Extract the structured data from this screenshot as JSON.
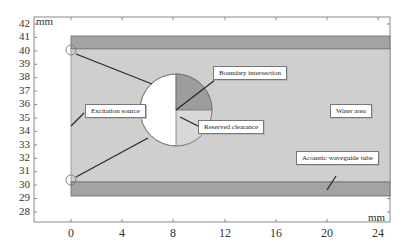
{
  "figure": {
    "units": {
      "x": "mm",
      "y": "mm"
    },
    "y_ticks": [
      "42",
      "41",
      "40",
      "39",
      "38",
      "37",
      "36",
      "35",
      "34",
      "33",
      "32",
      "31",
      "30",
      "29",
      "28"
    ],
    "x_ticks": [
      "0",
      "4",
      "8",
      "12",
      "16",
      "20",
      "24"
    ],
    "labels": {
      "excitation_source": "Excitation source",
      "boundary_intersection": "Boundary intersection",
      "reserved_clearance": "Reserved clearance",
      "water_area": "Water area",
      "waveguide_tube": "Acoustic waveguide tube"
    },
    "colors": {
      "tube_wall": "#a3a3a3",
      "water": "#cfcfcf",
      "sector_dark": "#9d9d9d",
      "sector_light": "#d8d8d8",
      "circle_fill": "#ffffff",
      "line": "#2a2a2a"
    }
  }
}
